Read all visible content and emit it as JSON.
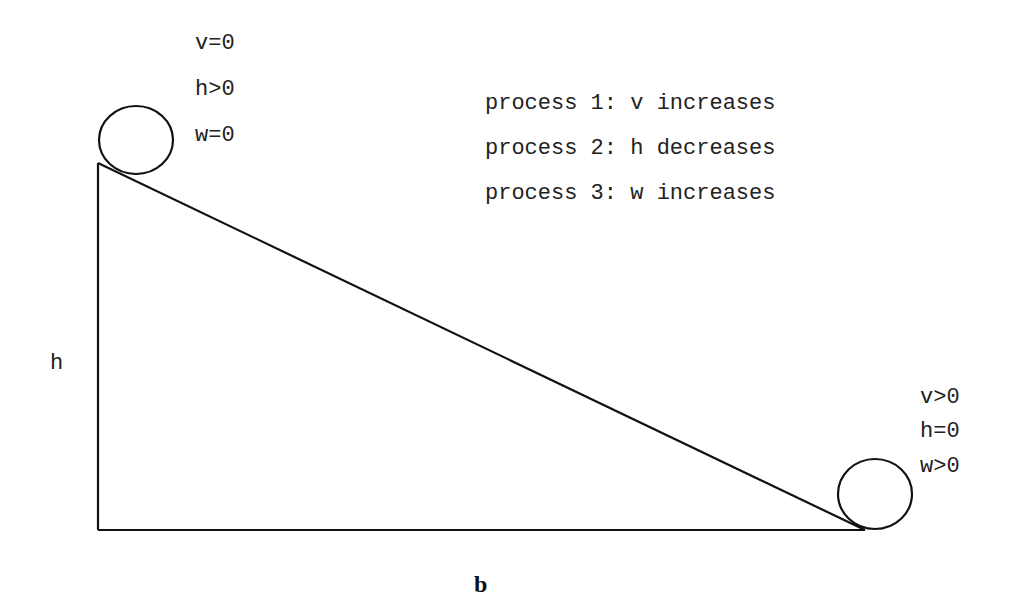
{
  "diagram": {
    "type": "inclined-plane-energy-processes",
    "labels": {
      "height": "h",
      "base": "b"
    },
    "start_state": {
      "lines": [
        "v=0",
        "h>0",
        "w=0"
      ]
    },
    "end_state": {
      "lines": [
        "v>0",
        "h=0",
        "w>0"
      ]
    },
    "processes": [
      "process 1: v increases",
      "process 2: h decreases",
      "process 3: w increases"
    ],
    "colors": {
      "line": "#111111",
      "text": "#222222",
      "background": "#ffffff"
    }
  }
}
